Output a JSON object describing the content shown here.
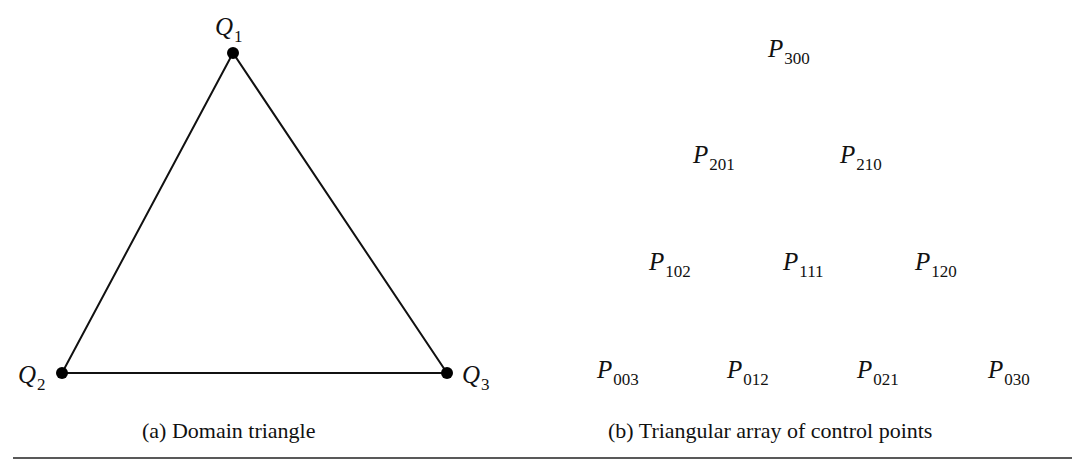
{
  "figure": {
    "panel_a": {
      "caption": "(a)  Domain triangle",
      "vertices": [
        {
          "name": "Q",
          "sub": "1",
          "x": 233,
          "y": 53
        },
        {
          "name": "Q",
          "sub": "2",
          "x": 62,
          "y": 373
        },
        {
          "name": "Q",
          "sub": "3",
          "x": 447,
          "y": 373
        }
      ]
    },
    "panel_b": {
      "caption": "(b)  Triangular array of control points",
      "points": [
        {
          "name": "P",
          "sub": "300"
        },
        {
          "name": "P",
          "sub": "201"
        },
        {
          "name": "P",
          "sub": "210"
        },
        {
          "name": "P",
          "sub": "102"
        },
        {
          "name": "P",
          "sub": "111"
        },
        {
          "name": "P",
          "sub": "120"
        },
        {
          "name": "P",
          "sub": "003"
        },
        {
          "name": "P",
          "sub": "012"
        },
        {
          "name": "P",
          "sub": "021"
        },
        {
          "name": "P",
          "sub": "030"
        }
      ]
    }
  }
}
